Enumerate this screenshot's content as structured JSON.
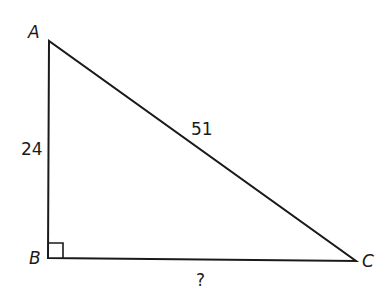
{
  "diagram": {
    "type": "right-triangle",
    "vertices": {
      "A": {
        "label": "A",
        "x": 49,
        "y": 41
      },
      "B": {
        "label": "B",
        "x": 48,
        "y": 258
      },
      "C": {
        "label": "C",
        "x": 356,
        "y": 261
      }
    },
    "right_angle_at": "B",
    "sides": {
      "AB": {
        "label": "24"
      },
      "AC": {
        "label": "51"
      },
      "BC": {
        "label": "?"
      }
    },
    "stroke_color": "#1a1a1a"
  }
}
